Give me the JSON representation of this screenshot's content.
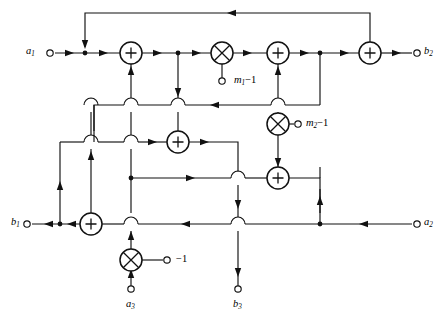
{
  "figure": {
    "type": "signal-flow-graph",
    "background": "#ffffff",
    "line_color": "#111111",
    "width": 445,
    "height": 321
  },
  "labels": {
    "a1": {
      "text": "a",
      "sub": "1",
      "x": 28,
      "y": 47
    },
    "a2": {
      "text": "a",
      "sub": "2",
      "x": 424,
      "y": 217
    },
    "a3": {
      "text": "a",
      "sub": "3",
      "x": 125,
      "y": 300
    },
    "b1": {
      "text": "b",
      "sub": "1",
      "x": 12,
      "y": 217
    },
    "b2": {
      "text": "b",
      "sub": "2",
      "x": 424,
      "y": 47
    },
    "b3": {
      "text": "b",
      "sub": "3",
      "x": 232,
      "y": 300
    },
    "m1": {
      "text": "m",
      "sub": "1",
      "suffix": "−1",
      "x": 235,
      "y": 75
    },
    "m2": {
      "text": "m",
      "sub": "2",
      "suffix": "−1",
      "x": 305,
      "y": 118
    },
    "neg1": {
      "text": "−1",
      "x": 174,
      "y": 254
    }
  },
  "terminals": [
    {
      "name": "a1-terminal",
      "label": "a1",
      "x": 50,
      "y": 53,
      "kind": "input"
    },
    {
      "name": "b2-terminal",
      "label": "b2",
      "x": 417,
      "y": 53,
      "kind": "output"
    },
    {
      "name": "m1-terminal",
      "label": "m1-1",
      "x": 223,
      "y": 82,
      "kind": "coefficient"
    },
    {
      "name": "m2-terminal",
      "label": "m2-1",
      "x": 298,
      "y": 124,
      "kind": "coefficient"
    },
    {
      "name": "b1-terminal",
      "label": "b1",
      "x": 27,
      "y": 224,
      "kind": "output"
    },
    {
      "name": "a2-terminal",
      "label": "a2",
      "x": 417,
      "y": 224,
      "kind": "input"
    },
    {
      "name": "neg1-terminal",
      "label": "-1",
      "x": 167,
      "y": 260,
      "kind": "coefficient"
    },
    {
      "name": "a3-terminal",
      "label": "a3",
      "x": 131,
      "y": 292,
      "kind": "input"
    },
    {
      "name": "b3-terminal",
      "label": "b3",
      "x": 238,
      "y": 292,
      "kind": "output"
    }
  ],
  "operators": [
    {
      "name": "adder-1",
      "symbol": "+",
      "x": 131,
      "y": 53,
      "r": 11
    },
    {
      "name": "multiplier-m1",
      "symbol": "x",
      "x": 222,
      "y": 53,
      "r": 11
    },
    {
      "name": "adder-2",
      "symbol": "+",
      "x": 278,
      "y": 53,
      "r": 11
    },
    {
      "name": "adder-3",
      "symbol": "+",
      "x": 370,
      "y": 53,
      "r": 11
    },
    {
      "name": "multiplier-m2",
      "symbol": "x",
      "x": 278,
      "y": 124,
      "r": 11
    },
    {
      "name": "adder-4",
      "symbol": "+",
      "x": 178,
      "y": 142,
      "r": 11
    },
    {
      "name": "adder-5",
      "symbol": "+",
      "x": 278,
      "y": 178,
      "r": 11
    },
    {
      "name": "adder-6",
      "symbol": "+",
      "x": 91,
      "y": 224,
      "r": 11
    },
    {
      "name": "multiplier-neg1",
      "symbol": "x",
      "x": 131,
      "y": 260,
      "r": 11
    }
  ],
  "junction_dots": [
    {
      "x": 85,
      "y": 53
    },
    {
      "x": 178,
      "y": 53
    },
    {
      "x": 320,
      "y": 53
    },
    {
      "x": 131,
      "y": 178
    },
    {
      "x": 60,
      "y": 224
    },
    {
      "x": 278,
      "y": 224
    }
  ],
  "hops": [
    {
      "x": 131,
      "y": 105
    },
    {
      "x": 178,
      "y": 105
    },
    {
      "x": 278,
      "y": 105
    },
    {
      "x": 91,
      "y": 142
    },
    {
      "x": 131,
      "y": 142
    },
    {
      "x": 238,
      "y": 178
    },
    {
      "x": 278,
      "y": 178
    },
    {
      "x": 131,
      "y": 224
    },
    {
      "x": 238,
      "y": 224
    }
  ],
  "wire_rows": {
    "top_feedback_y": 13,
    "main_row_y": 53,
    "mid_row_y": 105,
    "adder4_row_y": 142,
    "adder5_row_y": 178,
    "b1_row_y": 224
  }
}
